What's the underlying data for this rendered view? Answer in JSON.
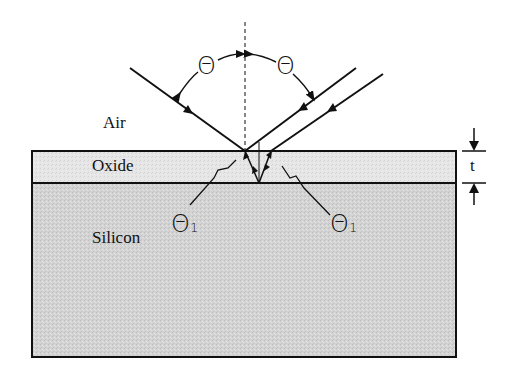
{
  "labels": {
    "air": "Air",
    "oxide": "Oxide",
    "silicon": "Silicon",
    "thickness": "t",
    "theta_left": "Θ",
    "theta_right": "Θ",
    "theta1_left": "Θ",
    "theta1_left_sub": "1",
    "theta1_right": "Θ",
    "theta1_right_sub": "1"
  },
  "colors": {
    "oxide_fill": "#e4e4e4",
    "silicon_fill": "#d2d2d2",
    "line": "#111111"
  }
}
